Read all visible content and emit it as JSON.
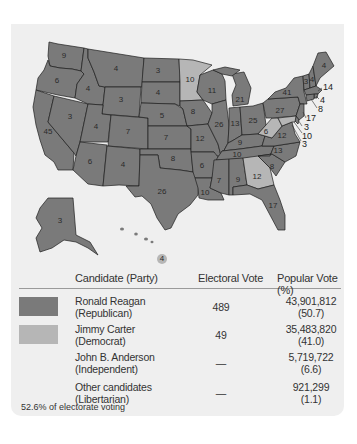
{
  "map": {
    "title": "1980 United States presidential election electoral map",
    "colors": {
      "republican": "#7a7a7a",
      "democrat": "#b6b6b6",
      "border": "#1e1e1e",
      "panel": "#efefef"
    },
    "states": [
      {
        "name": "Washington",
        "ev": "9",
        "winner": "Reagan"
      },
      {
        "name": "Oregon",
        "ev": "6",
        "winner": "Reagan"
      },
      {
        "name": "California",
        "ev": "45",
        "winner": "Reagan"
      },
      {
        "name": "Idaho",
        "ev": "4",
        "winner": "Reagan"
      },
      {
        "name": "Nevada",
        "ev": "3",
        "winner": "Reagan"
      },
      {
        "name": "Montana",
        "ev": "4",
        "winner": "Reagan"
      },
      {
        "name": "Wyoming",
        "ev": "3",
        "winner": "Reagan"
      },
      {
        "name": "Utah",
        "ev": "4",
        "winner": "Reagan"
      },
      {
        "name": "Arizona",
        "ev": "6",
        "winner": "Reagan"
      },
      {
        "name": "Colorado",
        "ev": "7",
        "winner": "Reagan"
      },
      {
        "name": "New Mexico",
        "ev": "4",
        "winner": "Reagan"
      },
      {
        "name": "North Dakota",
        "ev": "3",
        "winner": "Reagan"
      },
      {
        "name": "South Dakota",
        "ev": "4",
        "winner": "Reagan"
      },
      {
        "name": "Nebraska",
        "ev": "5",
        "winner": "Reagan"
      },
      {
        "name": "Kansas",
        "ev": "7",
        "winner": "Reagan"
      },
      {
        "name": "Oklahoma",
        "ev": "8",
        "winner": "Reagan"
      },
      {
        "name": "Texas",
        "ev": "26",
        "winner": "Reagan"
      },
      {
        "name": "Minnesota",
        "ev": "10",
        "winner": "Carter"
      },
      {
        "name": "Iowa",
        "ev": "8",
        "winner": "Reagan"
      },
      {
        "name": "Missouri",
        "ev": "12",
        "winner": "Reagan"
      },
      {
        "name": "Arkansas",
        "ev": "6",
        "winner": "Reagan"
      },
      {
        "name": "Louisiana",
        "ev": "10",
        "winner": "Reagan"
      },
      {
        "name": "Wisconsin",
        "ev": "11",
        "winner": "Reagan"
      },
      {
        "name": "Illinois",
        "ev": "26",
        "winner": "Reagan"
      },
      {
        "name": "Michigan",
        "ev": "21",
        "winner": "Reagan"
      },
      {
        "name": "Indiana",
        "ev": "13",
        "winner": "Reagan"
      },
      {
        "name": "Ohio",
        "ev": "25",
        "winner": "Reagan"
      },
      {
        "name": "Kentucky",
        "ev": "9",
        "winner": "Reagan"
      },
      {
        "name": "Tennessee",
        "ev": "10",
        "winner": "Reagan"
      },
      {
        "name": "Mississippi",
        "ev": "7",
        "winner": "Reagan"
      },
      {
        "name": "Alabama",
        "ev": "9",
        "winner": "Reagan"
      },
      {
        "name": "Georgia",
        "ev": "12",
        "winner": "Carter"
      },
      {
        "name": "Florida",
        "ev": "17",
        "winner": "Reagan"
      },
      {
        "name": "South Carolina",
        "ev": "8",
        "winner": "Reagan"
      },
      {
        "name": "North Carolina",
        "ev": "13",
        "winner": "Reagan"
      },
      {
        "name": "Virginia",
        "ev": "12",
        "winner": "Reagan"
      },
      {
        "name": "West Virginia",
        "ev": "6",
        "winner": "Carter"
      },
      {
        "name": "Pennsylvania",
        "ev": "27",
        "winner": "Reagan"
      },
      {
        "name": "New York",
        "ev": "41",
        "winner": "Reagan"
      },
      {
        "name": "Vermont",
        "ev": "3",
        "winner": "Reagan"
      },
      {
        "name": "New Hampshire",
        "ev": "4",
        "winner": "Reagan"
      },
      {
        "name": "Maine",
        "ev": "4",
        "winner": "Reagan"
      },
      {
        "name": "Massachusetts",
        "ev": "14",
        "winner": "Reagan"
      },
      {
        "name": "Rhode Island",
        "ev": "4",
        "winner": "Carter"
      },
      {
        "name": "Connecticut",
        "ev": "8",
        "winner": "Reagan"
      },
      {
        "name": "New Jersey",
        "ev": "17",
        "winner": "Reagan"
      },
      {
        "name": "Delaware",
        "ev": "3",
        "winner": "Reagan"
      },
      {
        "name": "Maryland",
        "ev": "10",
        "winner": "Carter"
      },
      {
        "name": "District of Columbia",
        "ev": "3",
        "winner": "Carter"
      },
      {
        "name": "Alaska",
        "ev": "3",
        "winner": "Reagan"
      },
      {
        "name": "Hawaii",
        "ev": "4",
        "winner": "Carter"
      }
    ],
    "callouts": [
      "14",
      "4",
      "8",
      "17",
      "3",
      "10",
      "3"
    ]
  },
  "table": {
    "headers": {
      "candidate": "Candidate (Party)",
      "electoral": "Electoral Vote",
      "popular": "Popular Vote (%)"
    },
    "rows": [
      {
        "name": "Ronald Reagan",
        "party": "(Republican)",
        "electoral": "489",
        "popular": "43,901,812",
        "percent": "(50.7)",
        "swatch": "#7a7a7a"
      },
      {
        "name": "Jimmy Carter",
        "party": "(Democrat)",
        "electoral": "49",
        "popular": "35,483,820",
        "percent": "(41.0)",
        "swatch": "#b6b6b6"
      },
      {
        "name": "John B. Anderson",
        "party": "(Independent)",
        "electoral": "—",
        "popular": "5,719,722",
        "percent": "(6.6)",
        "swatch": ""
      },
      {
        "name": "Other candidates",
        "party": "(Libertarian)",
        "electoral": "—",
        "popular": "921,299",
        "percent": "(1.1)",
        "swatch": ""
      }
    ]
  },
  "footer": {
    "turnout": "52.6% of electorate voting"
  }
}
